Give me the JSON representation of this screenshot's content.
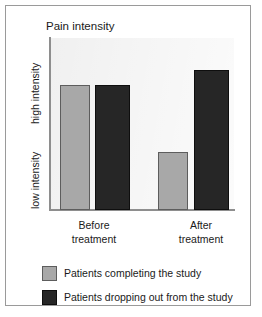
{
  "chart_data": {
    "type": "bar",
    "title": "Pain intensity",
    "xlabel": "",
    "ylabel": "",
    "grid": false,
    "legend_position": "bottom-left",
    "categories": [
      "Before treatment",
      "After treatment"
    ],
    "category_lines": [
      [
        "Before",
        "treatment"
      ],
      [
        "After",
        "treatment"
      ]
    ],
    "y_axis": {
      "tick_labels": [
        "high intensity",
        "low intensity"
      ],
      "high_label": "high intensity",
      "low_label": "low intensity",
      "range_description": "low intensity to high intensity",
      "numeric_scale": false
    },
    "series": [
      {
        "name": "Patients completing the study",
        "color": "#a8a8a8",
        "values": [
          0.73,
          0.34
        ],
        "value_labels": [
          "high",
          "low-moderate"
        ]
      },
      {
        "name": "Patients dropping out from the study",
        "color": "#262626",
        "values": [
          0.73,
          0.81
        ],
        "value_labels": [
          "high",
          "high"
        ]
      }
    ],
    "ylim": [
      0,
      1
    ],
    "annotations": []
  },
  "title": {
    "text": "Pain intensity"
  },
  "axes": {
    "y_high_label": "high intensity",
    "y_low_label": "low intensity",
    "x_labels": [
      {
        "line1": "Before",
        "line2": "treatment"
      },
      {
        "line1": "After",
        "line2": "treatment"
      }
    ]
  },
  "legend": {
    "items": [
      {
        "label": "Patients completing the study",
        "swatch": "light",
        "color": "#a8a8a8"
      },
      {
        "label": "Patients dropping out from the study",
        "swatch": "dark",
        "color": "#262626"
      }
    ]
  },
  "colors": {
    "series_light": "#a8a8a8",
    "series_dark": "#262626",
    "plot_background": "#f0f0f0",
    "frame_border": "#9a9a9a",
    "axis_line": "#8e8e8e",
    "text": "#1a1a1a"
  }
}
